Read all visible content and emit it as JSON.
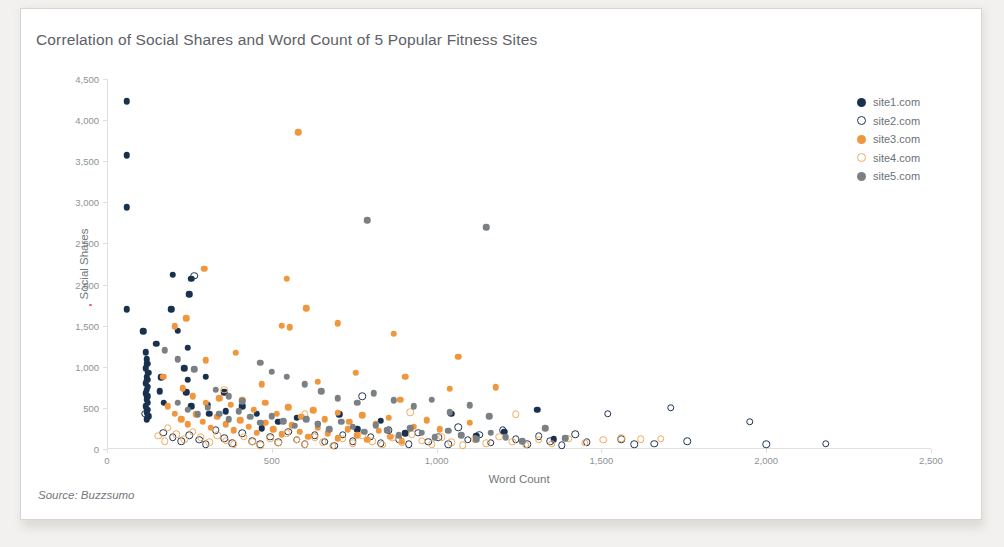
{
  "card": {
    "title": "Correlation of Social Shares and Word Count of 5 Popular Fitness Sites",
    "source_note": "Source: Buzzsumo"
  },
  "colors": {
    "site1": "#18314f",
    "site2": "#1d3557",
    "site3": "#f0963c",
    "site4": "#f4aa58",
    "site5": "#7b8085",
    "axis": "#e3e1de",
    "tick_text": "#8e9296",
    "title_text": "#5d6166",
    "card_bg": "#ffffff",
    "page_bg": "#f2f1ef"
  },
  "legend": {
    "position": "right",
    "items": [
      {
        "label": "site1.com",
        "color": "#18314f",
        "filled": true
      },
      {
        "label": "site2.com",
        "color": "#1d3557",
        "filled": false
      },
      {
        "label": "site3.com",
        "color": "#f0963c",
        "filled": true
      },
      {
        "label": "site4.com",
        "color": "#f4aa58",
        "filled": false
      },
      {
        "label": "site5.com",
        "color": "#7b8085",
        "filled": true
      }
    ]
  },
  "chart_data": {
    "type": "scatter",
    "title": "Correlation of Social Shares and Word Count of 5 Popular Fitness Sites",
    "xlabel": "Word Count",
    "ylabel": "Social Shares",
    "xlim": [
      0,
      2500
    ],
    "ylim": [
      0,
      4500
    ],
    "xticks": [
      0,
      500,
      1000,
      1500,
      2000,
      2500
    ],
    "xtick_labels": [
      "0",
      "500",
      "1,000",
      "1,500",
      "2,000",
      "2,500"
    ],
    "yticks": [
      0,
      500,
      1000,
      1500,
      2000,
      2500,
      3000,
      3500,
      4000,
      4500
    ],
    "ytick_labels": [
      "0",
      "500",
      "1,000",
      "1,500",
      "2,000",
      "2,500",
      "3,000",
      "3,500",
      "4,000",
      "4,500"
    ],
    "grid": false,
    "source": "Source: Buzzsumo",
    "series": [
      {
        "name": "site1.com",
        "color": "#18314f",
        "filled": true,
        "marker": "circle",
        "points": [
          [
            60,
            4230
          ],
          [
            60,
            3570
          ],
          [
            60,
            2940
          ],
          [
            60,
            1700
          ],
          [
            200,
            2120
          ],
          [
            255,
            2070
          ],
          [
            250,
            1880
          ],
          [
            195,
            1700
          ],
          [
            110,
            1430
          ],
          [
            215,
            1440
          ],
          [
            150,
            1280
          ],
          [
            245,
            1230
          ],
          [
            118,
            1175
          ],
          [
            120,
            1090
          ],
          [
            122,
            1035
          ],
          [
            118,
            985
          ],
          [
            125,
            930
          ],
          [
            120,
            880
          ],
          [
            122,
            840
          ],
          [
            118,
            800
          ],
          [
            124,
            760
          ],
          [
            120,
            720
          ],
          [
            118,
            680
          ],
          [
            122,
            640
          ],
          [
            120,
            600
          ],
          [
            124,
            560
          ],
          [
            118,
            520
          ],
          [
            122,
            480
          ],
          [
            120,
            440
          ],
          [
            125,
            400
          ],
          [
            120,
            360
          ],
          [
            165,
            870
          ],
          [
            160,
            700
          ],
          [
            172,
            560
          ],
          [
            235,
            980
          ],
          [
            245,
            840
          ],
          [
            240,
            690
          ],
          [
            255,
            520
          ],
          [
            300,
            880
          ],
          [
            305,
            540
          ],
          [
            310,
            430
          ],
          [
            355,
            690
          ],
          [
            360,
            460
          ],
          [
            410,
            520
          ],
          [
            455,
            430
          ],
          [
            470,
            250
          ],
          [
            520,
            330
          ],
          [
            575,
            380
          ],
          [
            640,
            310
          ],
          [
            705,
            420
          ],
          [
            760,
            240
          ],
          [
            830,
            345
          ],
          [
            905,
            190
          ],
          [
            1045,
            430
          ],
          [
            1120,
            160
          ],
          [
            1205,
            210
          ],
          [
            1305,
            480
          ],
          [
            1355,
            120
          ]
        ]
      },
      {
        "name": "site2.com",
        "color": "#1d3557",
        "filled": false,
        "marker": "circle",
        "points": [
          [
            265,
            2110
          ],
          [
            115,
            430
          ],
          [
            170,
            200
          ],
          [
            200,
            140
          ],
          [
            225,
            95
          ],
          [
            250,
            170
          ],
          [
            280,
            110
          ],
          [
            300,
            60
          ],
          [
            330,
            230
          ],
          [
            355,
            130
          ],
          [
            380,
            70
          ],
          [
            410,
            190
          ],
          [
            440,
            95
          ],
          [
            465,
            55
          ],
          [
            495,
            150
          ],
          [
            520,
            80
          ],
          [
            550,
            210
          ],
          [
            575,
            110
          ],
          [
            600,
            60
          ],
          [
            630,
            165
          ],
          [
            660,
            90
          ],
          [
            690,
            40
          ],
          [
            715,
            175
          ],
          [
            745,
            95
          ],
          [
            775,
            640
          ],
          [
            800,
            150
          ],
          [
            830,
            70
          ],
          [
            855,
            230
          ],
          [
            885,
            120
          ],
          [
            915,
            55
          ],
          [
            945,
            195
          ],
          [
            975,
            90
          ],
          [
            1005,
            140
          ],
          [
            1035,
            60
          ],
          [
            1065,
            265
          ],
          [
            1095,
            110
          ],
          [
            1130,
            175
          ],
          [
            1165,
            75
          ],
          [
            1200,
            230
          ],
          [
            1240,
            120
          ],
          [
            1275,
            60
          ],
          [
            1310,
            155
          ],
          [
            1345,
            95
          ],
          [
            1380,
            45
          ],
          [
            1420,
            180
          ],
          [
            1455,
            80
          ],
          [
            1520,
            430
          ],
          [
            1560,
            120
          ],
          [
            1600,
            60
          ],
          [
            1660,
            65
          ],
          [
            1710,
            500
          ],
          [
            1760,
            95
          ],
          [
            1950,
            330
          ],
          [
            2000,
            55
          ],
          [
            2180,
            65
          ]
        ]
      },
      {
        "name": "site3.com",
        "color": "#f0963c",
        "filled": true,
        "marker": "circle",
        "points": [
          [
            580,
            3850
          ],
          [
            295,
            2190
          ],
          [
            545,
            2070
          ],
          [
            605,
            1710
          ],
          [
            240,
            1590
          ],
          [
            205,
            1490
          ],
          [
            530,
            1500
          ],
          [
            555,
            1480
          ],
          [
            700,
            1530
          ],
          [
            870,
            1400
          ],
          [
            1065,
            1120
          ],
          [
            390,
            1170
          ],
          [
            300,
            1080
          ],
          [
            170,
            880
          ],
          [
            470,
            790
          ],
          [
            640,
            820
          ],
          [
            755,
            930
          ],
          [
            905,
            880
          ],
          [
            1040,
            730
          ],
          [
            1180,
            750
          ],
          [
            230,
            740
          ],
          [
            260,
            640
          ],
          [
            300,
            560
          ],
          [
            340,
            620
          ],
          [
            375,
            540
          ],
          [
            410,
            600
          ],
          [
            445,
            480
          ],
          [
            480,
            560
          ],
          [
            515,
            430
          ],
          [
            550,
            510
          ],
          [
            590,
            390
          ],
          [
            625,
            470
          ],
          [
            660,
            360
          ],
          [
            700,
            440
          ],
          [
            735,
            330
          ],
          [
            775,
            410
          ],
          [
            815,
            300
          ],
          [
            855,
            380
          ],
          [
            890,
            600
          ],
          [
            930,
            270
          ],
          [
            970,
            350
          ],
          [
            1010,
            240
          ],
          [
            1100,
            320
          ],
          [
            185,
            520
          ],
          [
            205,
            430
          ],
          [
            225,
            360
          ],
          [
            245,
            300
          ],
          [
            270,
            420
          ],
          [
            290,
            330
          ],
          [
            315,
            260
          ],
          [
            335,
            390
          ],
          [
            360,
            300
          ],
          [
            385,
            230
          ],
          [
            405,
            350
          ],
          [
            430,
            270
          ],
          [
            455,
            200
          ],
          [
            480,
            320
          ],
          [
            505,
            240
          ],
          [
            530,
            180
          ],
          [
            560,
            290
          ],
          [
            585,
            210
          ],
          [
            610,
            150
          ],
          [
            640,
            260
          ],
          [
            670,
            190
          ],
          [
            700,
            130
          ],
          [
            730,
            240
          ],
          [
            760,
            170
          ],
          [
            790,
            110
          ],
          [
            825,
            220
          ],
          [
            860,
            150
          ],
          [
            895,
            95
          ]
        ]
      },
      {
        "name": "site4.com",
        "color": "#f4aa58",
        "filled": false,
        "marker": "circle",
        "points": [
          [
            355,
            720
          ],
          [
            600,
            420
          ],
          [
            920,
            450
          ],
          [
            1240,
            420
          ],
          [
            185,
            260
          ],
          [
            210,
            180
          ],
          [
            235,
            120
          ],
          [
            260,
            210
          ],
          [
            285,
            140
          ],
          [
            310,
            80
          ],
          [
            335,
            170
          ],
          [
            360,
            100
          ],
          [
            385,
            60
          ],
          [
            415,
            150
          ],
          [
            440,
            90
          ],
          [
            465,
            45
          ],
          [
            495,
            130
          ],
          [
            520,
            75
          ],
          [
            545,
            190
          ],
          [
            575,
            110
          ],
          [
            600,
            55
          ],
          [
            630,
            145
          ],
          [
            655,
            85
          ],
          [
            685,
            40
          ],
          [
            715,
            125
          ],
          [
            745,
            70
          ],
          [
            775,
            165
          ],
          [
            805,
            95
          ],
          [
            835,
            50
          ],
          [
            865,
            135
          ],
          [
            895,
            75
          ],
          [
            925,
            180
          ],
          [
            955,
            100
          ],
          [
            985,
            55
          ],
          [
            1015,
            140
          ],
          [
            1045,
            80
          ],
          [
            1080,
            45
          ],
          [
            1115,
            120
          ],
          [
            1150,
            70
          ],
          [
            1190,
            150
          ],
          [
            1230,
            90
          ],
          [
            1270,
            50
          ],
          [
            1310,
            110
          ],
          [
            1350,
            65
          ],
          [
            1400,
            125
          ],
          [
            1450,
            75
          ],
          [
            1505,
            110
          ],
          [
            1560,
            130
          ],
          [
            1620,
            120
          ],
          [
            1680,
            125
          ],
          [
            155,
            160
          ],
          [
            175,
            95
          ]
        ]
      },
      {
        "name": "site5.com",
        "color": "#7b8085",
        "filled": true,
        "marker": "circle",
        "points": [
          [
            790,
            2780
          ],
          [
            1150,
            2700
          ],
          [
            175,
            1200
          ],
          [
            215,
            1090
          ],
          [
            265,
            970
          ],
          [
            465,
            1050
          ],
          [
            500,
            940
          ],
          [
            545,
            880
          ],
          [
            330,
            720
          ],
          [
            370,
            640
          ],
          [
            410,
            580
          ],
          [
            600,
            790
          ],
          [
            650,
            700
          ],
          [
            700,
            620
          ],
          [
            760,
            560
          ],
          [
            810,
            680
          ],
          [
            870,
            590
          ],
          [
            930,
            520
          ],
          [
            985,
            600
          ],
          [
            1040,
            450
          ],
          [
            1100,
            530
          ],
          [
            1160,
            400
          ],
          [
            215,
            560
          ],
          [
            245,
            480
          ],
          [
            275,
            420
          ],
          [
            305,
            500
          ],
          [
            340,
            430
          ],
          [
            370,
            360
          ],
          [
            400,
            460
          ],
          [
            435,
            390
          ],
          [
            465,
            320
          ],
          [
            500,
            400
          ],
          [
            535,
            340
          ],
          [
            570,
            280
          ],
          [
            605,
            360
          ],
          [
            640,
            300
          ],
          [
            675,
            240
          ],
          [
            710,
            330
          ],
          [
            745,
            270
          ],
          [
            780,
            210
          ],
          [
            815,
            290
          ],
          [
            850,
            230
          ],
          [
            885,
            170
          ],
          [
            920,
            250
          ],
          [
            955,
            195
          ],
          [
            995,
            145
          ],
          [
            1035,
            225
          ],
          [
            1075,
            165
          ],
          [
            1120,
            120
          ],
          [
            1165,
            200
          ],
          [
            1210,
            140
          ],
          [
            1260,
            95
          ],
          [
            1330,
            255
          ],
          [
            1390,
            130
          ]
        ]
      }
    ]
  }
}
